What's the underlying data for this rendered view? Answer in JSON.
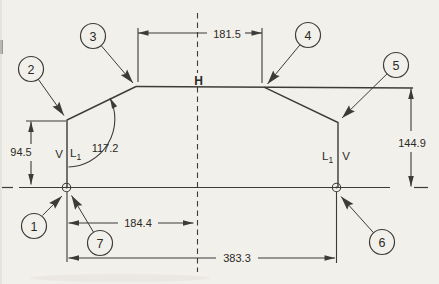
{
  "drawing": {
    "type": "dimensioned-profile-drawing",
    "dimensions": {
      "top_width": "181.5",
      "right_height": "144.9",
      "left_height": "94.5",
      "left_angle": "117.2",
      "left_to_center": "184.4",
      "overall_width": "383.3"
    },
    "labels": {
      "h_center": "H",
      "v_left": "V",
      "v_right": "V",
      "l1_left_base": "L",
      "l1_left_sub": "1",
      "l1_right_base": "L",
      "l1_right_sub": "1"
    },
    "balloons": [
      "1",
      "2",
      "3",
      "4",
      "5",
      "6",
      "7"
    ]
  },
  "colors": {
    "background": "#f2f0ea",
    "line": "#3d3b38",
    "text": "#2b2926"
  }
}
